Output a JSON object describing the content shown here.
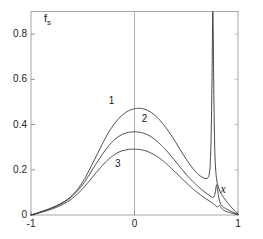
{
  "chart_data": {
    "type": "line",
    "title": "",
    "xlabel": "x",
    "ylabel": "f_s",
    "ylabel_base": "f",
    "ylabel_sub": "s",
    "xlim": [
      -1,
      1
    ],
    "ylim": [
      0,
      0.9
    ],
    "grid": false,
    "legend_position": "inline-annotations",
    "xticks": [
      -1,
      0,
      1
    ],
    "xticklabels": [
      "-1",
      "0",
      "1"
    ],
    "yticks": [
      0,
      0.2,
      0.4,
      0.6,
      0.8
    ],
    "yticklabels": [
      "0",
      "0.2",
      "0.4",
      "0.6",
      "0.8"
    ],
    "annotations": [
      {
        "text": "1",
        "x": -0.22,
        "y": 0.5
      },
      {
        "text": "2",
        "x": 0.1,
        "y": 0.42
      },
      {
        "text": "3",
        "x": -0.16,
        "y": 0.22
      },
      {
        "text": "x",
        "x": 0.86,
        "y": 0.115
      }
    ],
    "series": [
      {
        "name": "1",
        "label": "1",
        "color": "#333333",
        "peak_center_value": 0.47,
        "spike_x": 0.755,
        "spike_height": 0.9,
        "x": [
          -1.0,
          -0.96,
          -0.92,
          -0.88,
          -0.84,
          -0.8,
          -0.76,
          -0.72,
          -0.68,
          -0.64,
          -0.6,
          -0.56,
          -0.52,
          -0.48,
          -0.44,
          -0.4,
          -0.36,
          -0.32,
          -0.28,
          -0.24,
          -0.2,
          -0.16,
          -0.12,
          -0.08,
          -0.04,
          0.0,
          0.04,
          0.08,
          0.12,
          0.16,
          0.2,
          0.24,
          0.28,
          0.32,
          0.36,
          0.4,
          0.44,
          0.48,
          0.52,
          0.56,
          0.6,
          0.64,
          0.66,
          0.68,
          0.7,
          0.71,
          0.72,
          0.73,
          0.735,
          0.74,
          0.745,
          0.75,
          0.753,
          0.755,
          0.757,
          0.76,
          0.763,
          0.766,
          0.77,
          0.775,
          0.78,
          0.79,
          0.8,
          0.82,
          0.84,
          0.86,
          0.88,
          0.9,
          0.93,
          0.96,
          1.0
        ],
        "y": [
          0.0,
          0.006,
          0.012,
          0.018,
          0.025,
          0.032,
          0.04,
          0.049,
          0.059,
          0.072,
          0.088,
          0.108,
          0.133,
          0.162,
          0.196,
          0.232,
          0.269,
          0.306,
          0.341,
          0.373,
          0.4,
          0.423,
          0.441,
          0.455,
          0.465,
          0.47,
          0.472,
          0.47,
          0.464,
          0.454,
          0.44,
          0.422,
          0.4,
          0.376,
          0.349,
          0.32,
          0.29,
          0.261,
          0.233,
          0.208,
          0.187,
          0.171,
          0.166,
          0.162,
          0.162,
          0.165,
          0.175,
          0.21,
          0.26,
          0.34,
          0.47,
          0.64,
          0.78,
          0.87,
          0.9,
          0.83,
          0.7,
          0.56,
          0.42,
          0.3,
          0.23,
          0.17,
          0.14,
          0.11,
          0.092,
          0.078,
          0.066,
          0.054,
          0.038,
          0.022,
          0.004
        ]
      },
      {
        "name": "2",
        "label": "2",
        "color": "#333333",
        "peak_center_value": 0.368,
        "spike_x": 0.79,
        "spike_height": 0.135,
        "x": [
          -1.0,
          -0.96,
          -0.92,
          -0.88,
          -0.84,
          -0.8,
          -0.76,
          -0.72,
          -0.68,
          -0.64,
          -0.6,
          -0.56,
          -0.52,
          -0.48,
          -0.44,
          -0.4,
          -0.36,
          -0.32,
          -0.28,
          -0.24,
          -0.2,
          -0.16,
          -0.12,
          -0.08,
          -0.04,
          0.0,
          0.04,
          0.08,
          0.12,
          0.16,
          0.2,
          0.24,
          0.28,
          0.32,
          0.36,
          0.4,
          0.44,
          0.48,
          0.52,
          0.56,
          0.6,
          0.64,
          0.68,
          0.7,
          0.72,
          0.74,
          0.755,
          0.765,
          0.775,
          0.782,
          0.788,
          0.792,
          0.797,
          0.802,
          0.808,
          0.815,
          0.825,
          0.84,
          0.86,
          0.88,
          0.9,
          0.92,
          0.94,
          0.96,
          0.98,
          1.0
        ],
        "y": [
          0.0,
          0.005,
          0.011,
          0.017,
          0.023,
          0.03,
          0.038,
          0.047,
          0.057,
          0.069,
          0.084,
          0.102,
          0.123,
          0.148,
          0.176,
          0.205,
          0.234,
          0.262,
          0.288,
          0.311,
          0.33,
          0.345,
          0.356,
          0.363,
          0.367,
          0.368,
          0.367,
          0.363,
          0.356,
          0.346,
          0.333,
          0.317,
          0.299,
          0.279,
          0.257,
          0.235,
          0.212,
          0.19,
          0.169,
          0.15,
          0.132,
          0.116,
          0.101,
          0.094,
          0.087,
          0.081,
          0.078,
          0.079,
          0.09,
          0.105,
          0.124,
          0.134,
          0.13,
          0.114,
          0.094,
          0.075,
          0.057,
          0.044,
          0.035,
          0.029,
          0.024,
          0.019,
          0.015,
          0.011,
          0.006,
          0.002
        ]
      },
      {
        "name": "3",
        "label": "3",
        "color": "#333333",
        "peak_center_value": 0.291,
        "spike_x": 0.815,
        "spike_height": 0.042,
        "x": [
          -1.0,
          -0.96,
          -0.92,
          -0.88,
          -0.84,
          -0.8,
          -0.76,
          -0.72,
          -0.68,
          -0.64,
          -0.6,
          -0.56,
          -0.52,
          -0.48,
          -0.44,
          -0.4,
          -0.36,
          -0.32,
          -0.28,
          -0.24,
          -0.2,
          -0.16,
          -0.12,
          -0.08,
          -0.04,
          0.0,
          0.04,
          0.08,
          0.12,
          0.16,
          0.2,
          0.24,
          0.28,
          0.32,
          0.36,
          0.4,
          0.44,
          0.48,
          0.52,
          0.56,
          0.6,
          0.64,
          0.68,
          0.72,
          0.75,
          0.77,
          0.785,
          0.795,
          0.805,
          0.812,
          0.818,
          0.825,
          0.832,
          0.84,
          0.85,
          0.865,
          0.88,
          0.9,
          0.92,
          0.94,
          0.96,
          0.98,
          1.0
        ],
        "y": [
          0.0,
          0.004,
          0.009,
          0.014,
          0.02,
          0.026,
          0.033,
          0.041,
          0.05,
          0.061,
          0.074,
          0.089,
          0.107,
          0.127,
          0.149,
          0.171,
          0.193,
          0.214,
          0.234,
          0.251,
          0.265,
          0.276,
          0.284,
          0.288,
          0.291,
          0.291,
          0.29,
          0.287,
          0.282,
          0.274,
          0.264,
          0.252,
          0.238,
          0.222,
          0.205,
          0.187,
          0.169,
          0.151,
          0.134,
          0.117,
          0.102,
          0.088,
          0.075,
          0.063,
          0.054,
          0.047,
          0.041,
          0.037,
          0.036,
          0.039,
          0.042,
          0.041,
          0.037,
          0.031,
          0.026,
          0.02,
          0.016,
          0.013,
          0.011,
          0.008,
          0.006,
          0.003,
          0.001
        ]
      }
    ]
  },
  "axes": {
    "ylabel": {
      "base": "f",
      "sub": "s"
    },
    "xlabel": "x",
    "xticklabels": [
      "-1",
      "0",
      "1"
    ],
    "yticklabels": [
      "0",
      "0.2",
      "0.4",
      "0.6",
      "0.8"
    ],
    "curve_labels": [
      "1",
      "2",
      "3"
    ]
  },
  "colors": {
    "curve": "#333333",
    "axis": "#9a9a9a",
    "text": "#1a1a1a",
    "background": "#ffffff"
  }
}
